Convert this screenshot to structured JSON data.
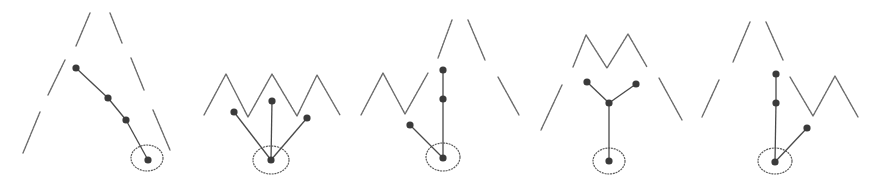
{
  "diagram": {
    "colors": {
      "background": "#ffffff",
      "lines": "#6a6a6a",
      "nodes": "#3a3a3a"
    },
    "panels": [
      {
        "id": "panel-1",
        "contours": [
          [
            [
              90,
              13
            ],
            [
              76,
              46
            ]
          ],
          [
            [
              65,
              60
            ],
            [
              48,
              95
            ]
          ],
          [
            [
              40,
              112
            ],
            [
              23,
              153
            ]
          ],
          [
            [
              110,
              13
            ],
            [
              122,
              43
            ]
          ],
          [
            [
              131,
              58
            ],
            [
              144,
              90
            ]
          ],
          [
            [
              153,
              110
            ],
            [
              170,
              150
            ]
          ]
        ],
        "nodes": [
          [
            76,
            68
          ],
          [
            108,
            98
          ],
          [
            126,
            120
          ],
          [
            148,
            160
          ]
        ],
        "edges": [
          [
            0,
            1
          ],
          [
            1,
            2
          ],
          [
            2,
            3
          ]
        ],
        "root": {
          "cx": 147,
          "cy": 158,
          "rx": 16,
          "ry": 13
        }
      },
      {
        "id": "panel-2",
        "contours": [
          [
            [
              204,
              115
            ],
            [
              226,
              74
            ],
            [
              248,
              117
            ],
            [
              272,
              74
            ],
            [
              297,
              116
            ],
            [
              317,
              75
            ],
            [
              340,
              115
            ]
          ]
        ],
        "nodes": [
          [
            234,
            112
          ],
          [
            272,
            101
          ],
          [
            307,
            118
          ],
          [
            271,
            160
          ]
        ],
        "edges": [
          [
            0,
            3
          ],
          [
            1,
            3
          ],
          [
            2,
            3
          ]
        ],
        "root": {
          "cx": 271,
          "cy": 160,
          "rx": 18,
          "ry": 14
        }
      },
      {
        "id": "panel-3",
        "contours": [
          [
            [
              361,
              115
            ],
            [
              383,
              73
            ],
            [
              405,
              114
            ],
            [
              428,
              73
            ]
          ],
          [
            [
              452,
              20
            ],
            [
              438,
              58
            ]
          ],
          [
            [
              468,
              20
            ],
            [
              485,
              60
            ]
          ],
          [
            [
              498,
              77
            ],
            [
              519,
              115
            ]
          ]
        ],
        "nodes": [
          [
            443,
            70
          ],
          [
            443,
            99
          ],
          [
            410,
            125
          ],
          [
            443,
            158
          ]
        ],
        "edges": [
          [
            0,
            1
          ],
          [
            1,
            3
          ],
          [
            2,
            3
          ]
        ],
        "root": {
          "cx": 443,
          "cy": 157,
          "rx": 17,
          "ry": 14
        }
      },
      {
        "id": "panel-4",
        "contours": [
          [
            [
              573,
              67
            ],
            [
              586,
              35
            ],
            [
              607,
              68
            ],
            [
              628,
              34
            ],
            [
              647,
              67
            ]
          ],
          [
            [
              562,
              85
            ],
            [
              541,
              130
            ]
          ],
          [
            [
              659,
              78
            ],
            [
              682,
              120
            ]
          ]
        ],
        "nodes": [
          [
            587,
            82
          ],
          [
            609,
            103
          ],
          [
            636,
            84
          ],
          [
            609,
            161
          ]
        ],
        "edges": [
          [
            0,
            1
          ],
          [
            2,
            1
          ],
          [
            1,
            3
          ]
        ],
        "root": {
          "cx": 609,
          "cy": 161,
          "rx": 16,
          "ry": 13
        }
      },
      {
        "id": "panel-5",
        "contours": [
          [
            [
              750,
              22
            ],
            [
              733,
              62
            ]
          ],
          [
            [
              766,
              22
            ],
            [
              783,
              60
            ]
          ],
          [
            [
              719,
              80
            ],
            [
              702,
              117
            ]
          ],
          [
            [
              790,
              77
            ],
            [
              813,
              116
            ],
            [
              835,
              76
            ],
            [
              858,
              117
            ]
          ]
        ],
        "nodes": [
          [
            776,
            74
          ],
          [
            776,
            103
          ],
          [
            807,
            128
          ],
          [
            775,
            162
          ]
        ],
        "edges": [
          [
            0,
            1
          ],
          [
            1,
            3
          ],
          [
            2,
            3
          ]
        ],
        "root": {
          "cx": 775,
          "cy": 161,
          "rx": 17,
          "ry": 13
        }
      }
    ]
  }
}
